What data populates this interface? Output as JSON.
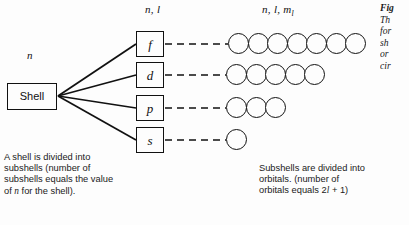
{
  "figure": {
    "headers": {
      "shell_label": "n",
      "subshell_label": "n, l",
      "orbital_label_pre": "n, l, m",
      "orbital_label_sub": "l"
    },
    "shell": {
      "box_label": "Shell"
    },
    "subshells": [
      {
        "label": "f",
        "orbital_count": 7
      },
      {
        "label": "d",
        "orbital_count": 5
      },
      {
        "label": "p",
        "orbital_count": 3
      },
      {
        "label": "s",
        "orbital_count": 1
      }
    ],
    "captions": {
      "shell_caption_line1": "A shell is divided into",
      "shell_caption_line2": "subshells (number of",
      "shell_caption_line3": "subshells equals the value",
      "shell_caption_line4_pre": "of ",
      "shell_caption_line4_italic": "n",
      "shell_caption_line4_post": " for the shell).",
      "orbital_caption_line1": "Subshells are divided into",
      "orbital_caption_line2": "orbitals. (number of",
      "orbital_caption_line3_pre": "orbitals equals 2",
      "orbital_caption_line3_italic": "l",
      "orbital_caption_line3_post": " + 1)"
    },
    "figure_caption_truncated": {
      "line1": "Fig",
      "line2": "Th",
      "line3": "for",
      "line4": "sh",
      "line5": "or",
      "line6": "cir"
    },
    "colors": {
      "ink": "#111111",
      "background": "#fdfdfd"
    }
  }
}
